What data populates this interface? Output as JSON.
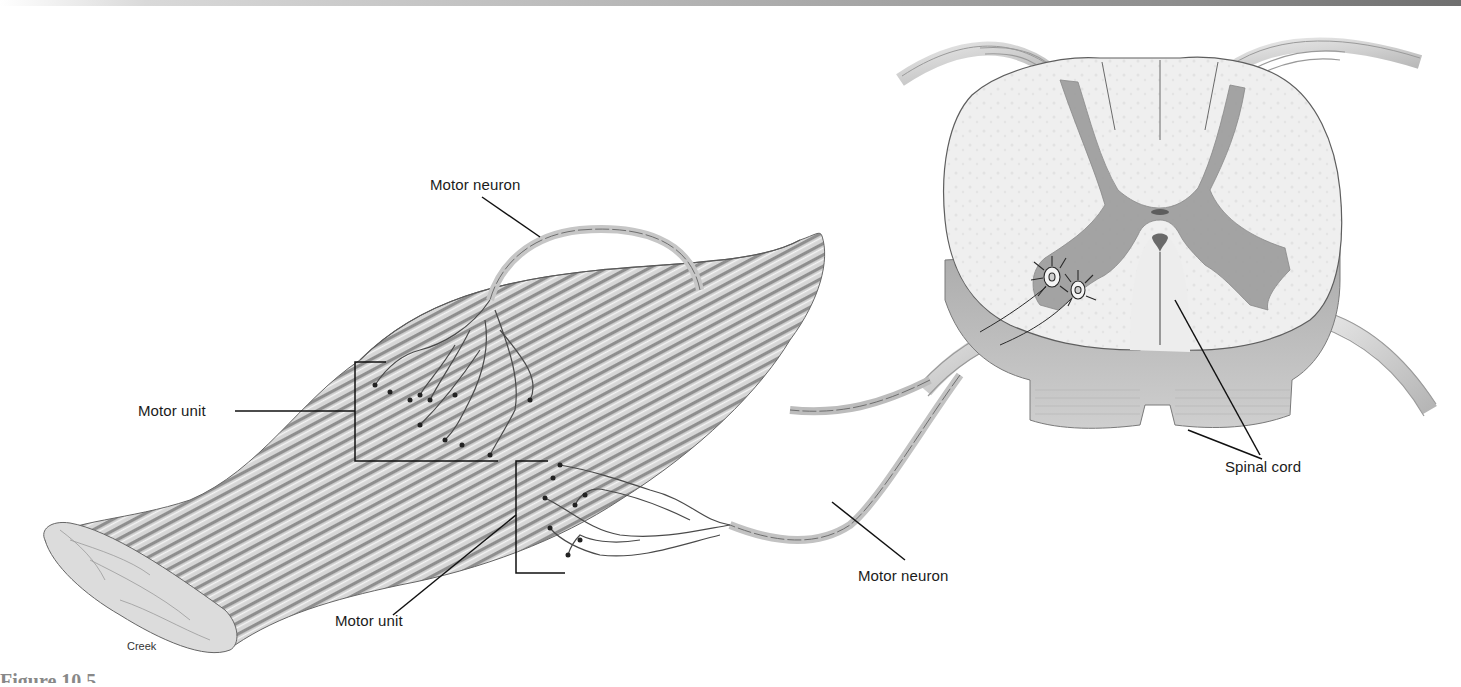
{
  "figure": {
    "labels": {
      "motor_neuron_top": "Motor neuron",
      "motor_unit_left": "Motor unit",
      "motor_unit_bottom": "Motor unit",
      "motor_neuron_right": "Motor neuron",
      "spinal_cord": "Spinal cord"
    },
    "credit": "Creek",
    "caption_partial": "Figure 10.5"
  },
  "colors": {
    "ink": "#1b1b1b",
    "muscle_fill": "#cfcfcf",
    "muscle_stripe": "#8f8f8f",
    "gray_matter": "#9a9a9a",
    "white_matter": "#ececec",
    "nerve": "#bdbdbd"
  }
}
